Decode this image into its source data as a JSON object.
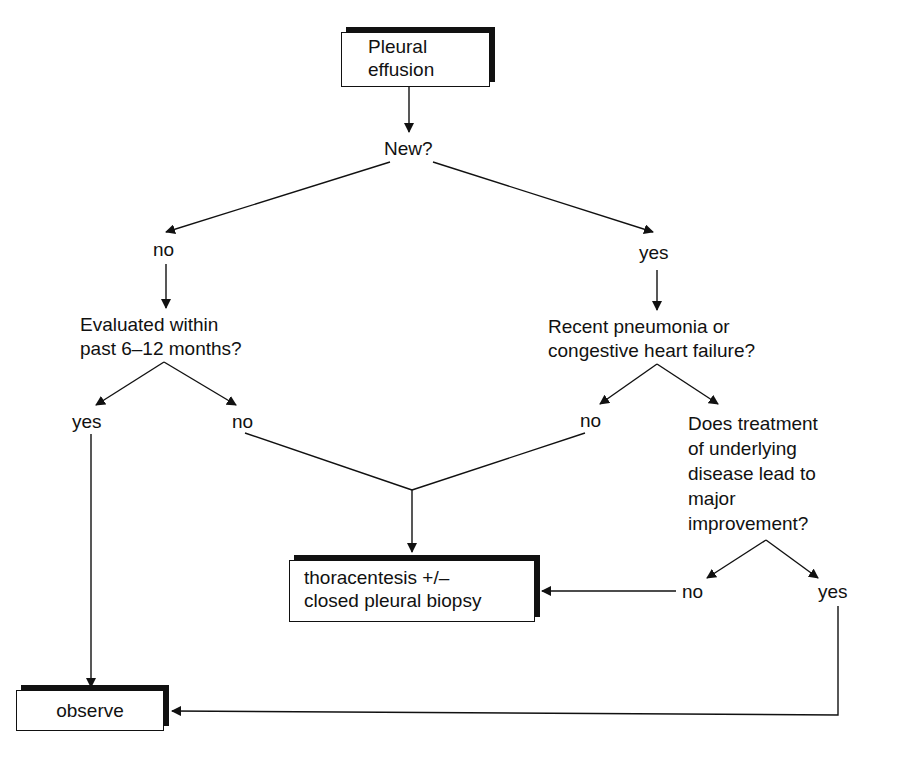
{
  "nodes": {
    "start": {
      "line1": "Pleural",
      "line2": "effusion"
    },
    "q_new": "New?",
    "new_no": "no",
    "new_yes": "yes",
    "q_evaluated": {
      "line1": "Evaluated within",
      "line2": "past 6–12 months?"
    },
    "eval_yes": "yes",
    "eval_no": "no",
    "q_recent": {
      "line1": "Recent pneumonia or",
      "line2": "congestive heart failure?"
    },
    "recent_no": "no",
    "q_treatment": {
      "line1": "Does treatment",
      "line2": "of underlying",
      "line3": "disease lead to",
      "line4": "major",
      "line5": "improvement?"
    },
    "treat_no": "no",
    "treat_yes": "yes",
    "thoracentesis": {
      "line1": "thoracentesis +/–",
      "line2": "closed pleural biopsy"
    },
    "observe": "observe"
  },
  "colors": {
    "line": "#111111",
    "background": "#ffffff"
  }
}
